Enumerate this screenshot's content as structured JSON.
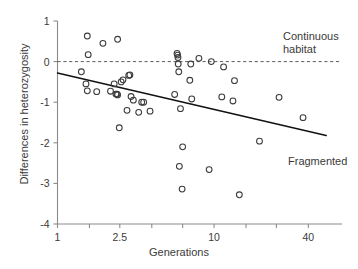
{
  "chart_data": {
    "type": "scatter",
    "title": "",
    "xlabel": "Generations",
    "ylabel": "Differences in heterozygosity",
    "xscale": "log",
    "xlim": [
      1,
      55
    ],
    "ylim": [
      -4,
      1
    ],
    "grid": false,
    "legend_position": "none",
    "xticks": [
      1,
      2.5,
      10,
      40
    ],
    "xtick_labels": [
      "1",
      "2.5",
      "10",
      "40"
    ],
    "xminor_ticks": [
      1.6,
      4,
      6.3,
      16,
      25
    ],
    "yticks": [
      1,
      0,
      -1,
      -2,
      -3,
      -4
    ],
    "ytick_labels": [
      "1",
      "0",
      "-1",
      "-2",
      "-3",
      "-4"
    ],
    "series": [
      {
        "name": "populations",
        "marker": "open-circle",
        "color": "#3c3c3c",
        "points": [
          {
            "x": 1.55,
            "y": 0.63
          },
          {
            "x": 1.57,
            "y": 0.17
          },
          {
            "x": 1.95,
            "y": 0.45
          },
          {
            "x": 2.42,
            "y": 0.55
          },
          {
            "x": 1.42,
            "y": -0.25
          },
          {
            "x": 1.52,
            "y": -0.55
          },
          {
            "x": 1.55,
            "y": -0.72
          },
          {
            "x": 1.78,
            "y": -0.74
          },
          {
            "x": 2.18,
            "y": -0.73
          },
          {
            "x": 2.3,
            "y": -0.55
          },
          {
            "x": 2.36,
            "y": -0.8
          },
          {
            "x": 2.4,
            "y": -0.8
          },
          {
            "x": 2.42,
            "y": -0.82
          },
          {
            "x": 2.48,
            "y": -1.63
          },
          {
            "x": 2.55,
            "y": -0.5
          },
          {
            "x": 2.62,
            "y": -0.45
          },
          {
            "x": 2.85,
            "y": -0.34
          },
          {
            "x": 2.9,
            "y": -0.33
          },
          {
            "x": 2.78,
            "y": -1.2
          },
          {
            "x": 2.95,
            "y": -0.86
          },
          {
            "x": 3.05,
            "y": -0.95
          },
          {
            "x": 3.3,
            "y": -1.25
          },
          {
            "x": 3.45,
            "y": -1.0
          },
          {
            "x": 3.55,
            "y": -1.0
          },
          {
            "x": 3.9,
            "y": -1.22
          },
          {
            "x": 5.6,
            "y": -0.81
          },
          {
            "x": 5.8,
            "y": 0.2
          },
          {
            "x": 5.85,
            "y": 0.16
          },
          {
            "x": 5.88,
            "y": 0.1
          },
          {
            "x": 5.9,
            "y": -0.06
          },
          {
            "x": 5.95,
            "y": -0.25
          },
          {
            "x": 6.1,
            "y": -1.16
          },
          {
            "x": 6.3,
            "y": -2.1
          },
          {
            "x": 6.0,
            "y": -2.58
          },
          {
            "x": 6.25,
            "y": -3.14
          },
          {
            "x": 7.1,
            "y": -0.06
          },
          {
            "x": 7.2,
            "y": -0.92
          },
          {
            "x": 7.0,
            "y": -0.46
          },
          {
            "x": 8.0,
            "y": 0.08
          },
          {
            "x": 9.6,
            "y": 0.0
          },
          {
            "x": 9.3,
            "y": -2.66
          },
          {
            "x": 11.5,
            "y": -0.13
          },
          {
            "x": 11.2,
            "y": -0.87
          },
          {
            "x": 13.5,
            "y": -0.47
          },
          {
            "x": 13.2,
            "y": -0.97
          },
          {
            "x": 14.5,
            "y": -3.28
          },
          {
            "x": 19.5,
            "y": -1.96
          },
          {
            "x": 26.0,
            "y": -0.88
          },
          {
            "x": 37.0,
            "y": -1.38
          }
        ]
      }
    ],
    "reference_lines": [
      {
        "name": "continuous-habitat-baseline",
        "style": "dashed",
        "y": 0,
        "label": "Continuous\nhabitat"
      },
      {
        "name": "fragmented-trend",
        "style": "solid",
        "x_start": 1.0,
        "y_start": -0.28,
        "x_end": 52,
        "y_end": -1.82,
        "label": "Fragmented"
      }
    ],
    "annotations": [
      {
        "name": "continuous-habitat-label",
        "text": "Continuous\nhabitat"
      },
      {
        "name": "fragmented-label",
        "text": "Fragmented"
      }
    ]
  },
  "labels": {
    "xlabel": "Generations",
    "ylabel": "Differences in heterozygosity",
    "continuous": "Continuous\nhabitat",
    "fragmented": "Fragmented"
  }
}
